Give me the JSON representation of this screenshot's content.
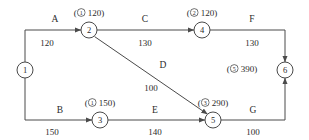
{
  "diagram": {
    "type": "activity-on-arrow-network",
    "nodes": [
      {
        "id": "n1",
        "label": "1",
        "x": 25,
        "y": 70,
        "r": 8
      },
      {
        "id": "n2",
        "label": "2",
        "x": 89,
        "y": 30,
        "r": 8
      },
      {
        "id": "n3",
        "label": "3",
        "x": 100,
        "y": 120,
        "r": 8
      },
      {
        "id": "n4",
        "label": "4",
        "x": 202,
        "y": 30,
        "r": 8
      },
      {
        "id": "n5",
        "label": "5",
        "x": 213,
        "y": 120,
        "r": 8
      },
      {
        "id": "n6",
        "label": "6",
        "x": 285,
        "y": 70,
        "r": 8
      }
    ],
    "activities": [
      {
        "id": "A",
        "name": "A",
        "duration": "120",
        "from": "n1",
        "to": "n2",
        "name_x": 55,
        "name_y": 20,
        "dur_x": 47,
        "dur_y": 43
      },
      {
        "id": "C",
        "name": "C",
        "duration": "130",
        "from": "n2",
        "to": "n4",
        "name_x": 145,
        "name_y": 20,
        "dur_x": 145,
        "dur_y": 43
      },
      {
        "id": "F",
        "name": "F",
        "duration": "130",
        "from": "n4",
        "to": "n6",
        "name_x": 252,
        "name_y": 20,
        "dur_x": 252,
        "dur_y": 43
      },
      {
        "id": "B",
        "name": "B",
        "duration": "150",
        "from": "n1",
        "to": "n3",
        "name_x": 60,
        "name_y": 111,
        "dur_x": 52,
        "dur_y": 132
      },
      {
        "id": "E",
        "name": "E",
        "duration": "140",
        "from": "n3",
        "to": "n5",
        "name_x": 155,
        "name_y": 111,
        "dur_x": 155,
        "dur_y": 132
      },
      {
        "id": "G",
        "name": "G",
        "duration": "100",
        "from": "n5",
        "to": "n6",
        "name_x": 253,
        "name_y": 111,
        "dur_x": 253,
        "dur_y": 132
      },
      {
        "id": "D",
        "name": "D",
        "duration": "100",
        "from": "n2",
        "to": "n5",
        "name_x": 163,
        "name_y": 66,
        "dur_x": 151,
        "dur_y": 88
      }
    ],
    "annotations": [
      {
        "id": "ann-n2",
        "node": "n2",
        "circled": "1",
        "value": "120",
        "x": 89,
        "y": 13
      },
      {
        "id": "ann-n4",
        "node": "n4",
        "circled": "2",
        "value": "120",
        "x": 202,
        "y": 13
      },
      {
        "id": "ann-n3",
        "node": "n3",
        "circled": "1",
        "value": "150",
        "x": 100,
        "y": 103
      },
      {
        "id": "ann-n5",
        "node": "n5",
        "circled": "3",
        "value": "290",
        "x": 213,
        "y": 103
      },
      {
        "id": "ann-n6",
        "node": "n6",
        "circled": "5",
        "value": "390",
        "x": 242,
        "y": 69
      }
    ],
    "colors": {
      "stroke": "#4a4a4a",
      "text": "#2b2b2b",
      "background": "#ffffff"
    }
  }
}
